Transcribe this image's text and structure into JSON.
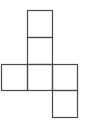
{
  "diagram": {
    "title": "",
    "type": "cube-net",
    "stroke_color": "#4a4a4a",
    "background": "#ffffff",
    "squares": [
      {
        "id": "top-1",
        "x": 27,
        "y": 10,
        "w": 25,
        "h": 27
      },
      {
        "id": "top-2",
        "x": 27,
        "y": 37,
        "w": 25,
        "h": 27
      },
      {
        "id": "middle-left",
        "x": 1,
        "y": 64,
        "w": 26,
        "h": 26
      },
      {
        "id": "middle-center",
        "x": 27,
        "y": 64,
        "w": 25,
        "h": 26
      },
      {
        "id": "middle-right",
        "x": 52,
        "y": 64,
        "w": 25,
        "h": 26
      },
      {
        "id": "bottom",
        "x": 52,
        "y": 90,
        "w": 25,
        "h": 27
      }
    ]
  }
}
